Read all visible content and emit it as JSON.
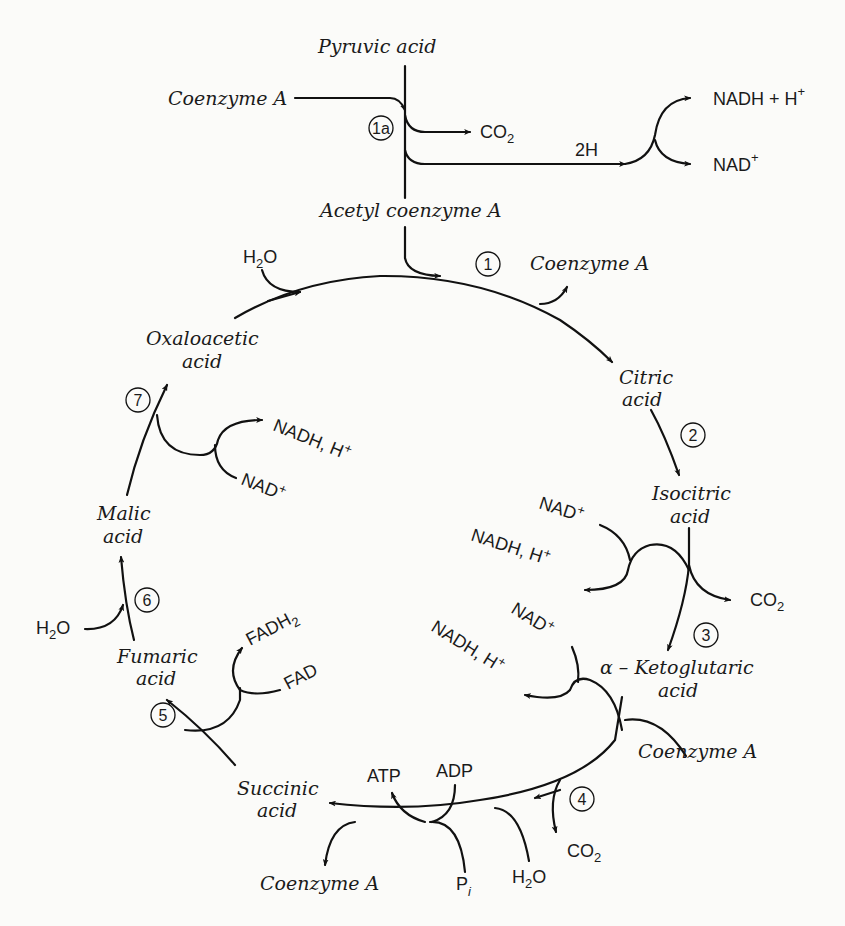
{
  "diagram": {
    "colors": {
      "ink": "#111111",
      "background": "#fbfbf9"
    },
    "entry": {
      "pyruvic_acid": "Pyruvic acid",
      "coenzyme_a_in": "Coenzyme A",
      "step_1a": "1a",
      "co2_out": "CO",
      "co2_sub": "2",
      "two_h": "2H",
      "nadh_plus_h": "NADH + H",
      "nadh_plus_h_sup": "+",
      "nad_plus": "NAD",
      "nad_plus_sup": "+",
      "acetyl_coa": "Acetyl coenzyme A"
    },
    "intermediates": {
      "oxaloacetic_1": "Oxaloacetic",
      "oxaloacetic_2": "acid",
      "citric_1": "Citric",
      "citric_2": "acid",
      "isocitric_1": "Isocitric",
      "isocitric_2": "acid",
      "ketoglutaric_1": "α – Ketoglutaric",
      "ketoglutaric_2": "acid",
      "succinic_1": "Succinic",
      "succinic_2": "acid",
      "fumaric_1": "Fumaric",
      "fumaric_2": "acid",
      "malic_1": "Malic",
      "malic_2": "acid"
    },
    "steps": [
      "1",
      "2",
      "3",
      "4",
      "5",
      "6",
      "7"
    ],
    "cofactors": {
      "step1_h2o": "H",
      "step1_h2o_sub": "2",
      "step1_h2o_o": "O",
      "step1_coa_out": "Coenzyme A",
      "step3_nad": "NAD",
      "step3_nad_sup": "+",
      "step3_nadh": "NADH, H",
      "step3_nadh_sup": "+",
      "step3_co2": "CO",
      "step3_co2_sub": "2",
      "step4_nad": "NAD",
      "step4_nad_sup": "+",
      "step4_nadh": "NADH, H",
      "step4_nadh_sup": "+",
      "step4_coa_in": "Coenzyme A",
      "step4_co2": "CO",
      "step4_co2_sub": "2",
      "step4_h2o": "H",
      "step4_h2o_sub": "2",
      "step4_h2o_o": "O",
      "step4_pi": "P",
      "step4_pi_sub": "i",
      "step4_atp": "ATP",
      "step4_adp": "ADP",
      "step4_coa_out": "Coenzyme A",
      "step5_fadh2": "FADH",
      "step5_fadh2_sub": "2",
      "step5_fad": "FAD",
      "step6_h2o": "H",
      "step6_h2o_sub": "2",
      "step6_h2o_o": "O",
      "step7_nadh": "NADH, H",
      "step7_nadh_sup": "+",
      "step7_nad": "NAD",
      "step7_nad_sup": "+"
    }
  }
}
